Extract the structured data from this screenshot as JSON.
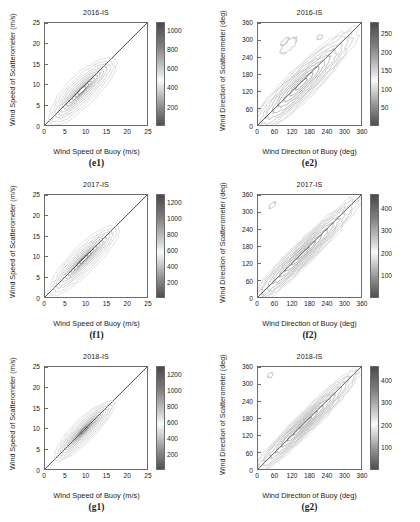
{
  "figure": {
    "width": 420,
    "height": 522,
    "background": "#ffffff",
    "line_color": "#6b6b6b",
    "diagonal_color": "#2b2b2b"
  },
  "chart_data": [
    {
      "id": "e1",
      "type": "contour",
      "caption": "(e1)",
      "title": "2016-IS",
      "xlabel": "Wind Speed of Buoy (m/s)",
      "ylabel": "Wind Speed of Scatterometer (m/s)",
      "xlim": [
        0,
        25
      ],
      "ylim": [
        0,
        25
      ],
      "xticks": [
        0,
        5,
        10,
        15,
        20,
        25
      ],
      "yticks": [
        0,
        5,
        10,
        15,
        20,
        25
      ],
      "grid": false,
      "reference_line": "1:1 diagonal",
      "colorbar": {
        "ticks": [
          200,
          400,
          600,
          800,
          1000
        ],
        "min": 0,
        "max": 1080,
        "colormap": "gray-reversed",
        "position": "right"
      },
      "density_peak": [
        6.5,
        6.2
      ],
      "cloud_extent": [
        [
          2,
          15
        ],
        [
          2,
          15
        ]
      ]
    },
    {
      "id": "e2",
      "type": "contour",
      "caption": "(e2)",
      "title": "2016-IS",
      "xlabel": "Wind Direction of Buoy (deg)",
      "ylabel": "Wind Direction of Scatterometer (deg)",
      "xlim": [
        0,
        360
      ],
      "ylim": [
        0,
        360
      ],
      "xticks": [
        0,
        60,
        120,
        180,
        240,
        300,
        360
      ],
      "yticks": [
        0,
        60,
        120,
        180,
        240,
        300,
        360
      ],
      "grid": false,
      "reference_line": "1:1 diagonal",
      "colorbar": {
        "ticks": [
          50,
          100,
          150,
          200,
          250
        ],
        "min": 0,
        "max": 280,
        "colormap": "gray-reversed",
        "position": "right"
      },
      "density_peak": [
        100,
        95
      ],
      "cloud_extent": [
        [
          10,
          360
        ],
        [
          10,
          360
        ]
      ]
    },
    {
      "id": "f1",
      "type": "contour",
      "caption": "(f1)",
      "title": "2017-IS",
      "xlabel": "Wind Speed of Buoy (m/s)",
      "ylabel": "Wind Speed of Scatterometer (m/s)",
      "xlim": [
        0,
        25
      ],
      "ylim": [
        0,
        25
      ],
      "xticks": [
        0,
        5,
        10,
        15,
        20,
        25
      ],
      "yticks": [
        0,
        5,
        10,
        15,
        20,
        25
      ],
      "grid": false,
      "reference_line": "1:1 diagonal",
      "colorbar": {
        "ticks": [
          200,
          400,
          600,
          800,
          1000,
          1200
        ],
        "min": 0,
        "max": 1300,
        "colormap": "gray-reversed",
        "position": "right"
      },
      "density_peak": [
        7.5,
        7.8
      ],
      "cloud_extent": [
        [
          2,
          16
        ],
        [
          2,
          16
        ]
      ]
    },
    {
      "id": "f2",
      "type": "contour",
      "caption": "(f2)",
      "title": "2017-IS",
      "xlabel": "Wind Direction of Buoy (deg)",
      "ylabel": "Wind Direction of Scatterometer (deg)",
      "xlim": [
        0,
        360
      ],
      "ylim": [
        0,
        360
      ],
      "xticks": [
        0,
        60,
        120,
        180,
        240,
        300,
        360
      ],
      "yticks": [
        0,
        60,
        120,
        180,
        240,
        300,
        360
      ],
      "grid": false,
      "reference_line": "1:1 diagonal",
      "colorbar": {
        "ticks": [
          100,
          200,
          300,
          400
        ],
        "min": 0,
        "max": 460,
        "colormap": "gray-reversed",
        "position": "right"
      },
      "density_peak": [
        95,
        100
      ],
      "cloud_extent": [
        [
          10,
          360
        ],
        [
          10,
          360
        ]
      ]
    },
    {
      "id": "g1",
      "type": "contour",
      "caption": "(g1)",
      "title": "2018-IS",
      "xlabel": "Wind Speed of Buoy (m/s)",
      "ylabel": "Wind Speed of Scatterometer (m/s)",
      "xlim": [
        0,
        25
      ],
      "ylim": [
        0,
        25
      ],
      "xticks": [
        0,
        5,
        10,
        15,
        20,
        25
      ],
      "yticks": [
        0,
        5,
        10,
        15,
        20,
        25
      ],
      "grid": false,
      "reference_line": "1:1 diagonal",
      "colorbar": {
        "ticks": [
          200,
          400,
          600,
          800,
          1000,
          1200
        ],
        "min": 0,
        "max": 1300,
        "colormap": "gray-reversed",
        "position": "right"
      },
      "density_peak": [
        8.5,
        9.0
      ],
      "cloud_extent": [
        [
          2,
          14
        ],
        [
          2,
          14
        ]
      ]
    },
    {
      "id": "g2",
      "type": "contour",
      "caption": "(g2)",
      "title": "2018-IS",
      "xlabel": "Wind Direction of Buoy (deg)",
      "ylabel": "Wind Direction of Scatterometer (deg)",
      "xlim": [
        0,
        360
      ],
      "ylim": [
        0,
        360
      ],
      "xticks": [
        0,
        60,
        120,
        180,
        240,
        300,
        360
      ],
      "yticks": [
        0,
        60,
        120,
        180,
        240,
        300,
        360
      ],
      "grid": false,
      "reference_line": "1:1 diagonal",
      "colorbar": {
        "ticks": [
          100,
          200,
          300,
          400
        ],
        "min": 0,
        "max": 460,
        "colormap": "gray-reversed",
        "position": "right"
      },
      "density_peak": [
        110,
        115
      ],
      "cloud_extent": [
        [
          10,
          360
        ],
        [
          10,
          360
        ]
      ]
    }
  ]
}
